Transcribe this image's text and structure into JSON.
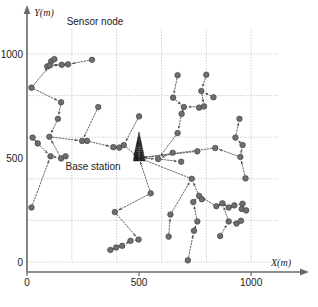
{
  "figure": {
    "title": "",
    "annotations": [
      {
        "name": "sensor-node-label",
        "text": "Sensor node",
        "x": 95,
        "y": 22
      },
      {
        "name": "base-station-label",
        "text": "Base station",
        "x": 93,
        "y": 167
      }
    ],
    "base_station": {
      "label": "Base station",
      "x_m": 500,
      "y_m": 500
    },
    "axis": {
      "x_label": "X(m)",
      "y_label": "Y(m)",
      "x_ticks": [
        {
          "value": 0,
          "label": "0"
        },
        {
          "value": 500,
          "label": "500"
        },
        {
          "value": 1000,
          "label": "1000"
        }
      ],
      "y_ticks": [
        {
          "value": 0,
          "label": "0"
        },
        {
          "value": 500,
          "label": "500"
        },
        {
          "value": 1000,
          "label": "1000"
        }
      ],
      "x_range": [
        0,
        1120
      ],
      "y_range": [
        0,
        1120
      ],
      "grid": true,
      "grid_step": 200
    }
  },
  "chart_data": {
    "type": "scatter",
    "title": "",
    "xlabel": "X(m)",
    "ylabel": "Y(m)",
    "xlim": [
      0,
      1120
    ],
    "ylim": [
      0,
      1120
    ],
    "grid": true,
    "grid_step": 200,
    "legend": [],
    "annotations": [
      "Sensor node",
      "Base station"
    ],
    "marker": {
      "shape": "circle",
      "color": "#6e6e6e",
      "edge": "#3a3a3a",
      "size": 4.6
    },
    "edge_style": {
      "color": "#4a4a4a",
      "dash": "dotted",
      "arrow": true
    },
    "base_station": {
      "x": 500,
      "y": 500
    },
    "nodes": [
      {
        "id": 0,
        "x": 500,
        "y": 500
      },
      {
        "id": 1,
        "x": 108,
        "y": 965
      },
      {
        "id": 2,
        "x": 122,
        "y": 975
      },
      {
        "id": 3,
        "x": 90,
        "y": 940
      },
      {
        "id": 4,
        "x": 102,
        "y": 945
      },
      {
        "id": 5,
        "x": 155,
        "y": 948
      },
      {
        "id": 6,
        "x": 183,
        "y": 950
      },
      {
        "id": 7,
        "x": 290,
        "y": 972
      },
      {
        "id": 8,
        "x": 20,
        "y": 838
      },
      {
        "id": 9,
        "x": 152,
        "y": 768
      },
      {
        "id": 10,
        "x": 138,
        "y": 688
      },
      {
        "id": 11,
        "x": 100,
        "y": 602
      },
      {
        "id": 12,
        "x": 25,
        "y": 598
      },
      {
        "id": 13,
        "x": 48,
        "y": 570
      },
      {
        "id": 14,
        "x": 105,
        "y": 508
      },
      {
        "id": 15,
        "x": 152,
        "y": 498
      },
      {
        "id": 16,
        "x": 172,
        "y": 508
      },
      {
        "id": 17,
        "x": 20,
        "y": 262
      },
      {
        "id": 18,
        "x": 246,
        "y": 582
      },
      {
        "id": 19,
        "x": 268,
        "y": 582
      },
      {
        "id": 20,
        "x": 318,
        "y": 745
      },
      {
        "id": 21,
        "x": 385,
        "y": 552
      },
      {
        "id": 22,
        "x": 412,
        "y": 550
      },
      {
        "id": 23,
        "x": 432,
        "y": 562
      },
      {
        "id": 24,
        "x": 500,
        "y": 700
      },
      {
        "id": 25,
        "x": 552,
        "y": 330
      },
      {
        "id": 26,
        "x": 392,
        "y": 240
      },
      {
        "id": 27,
        "x": 498,
        "y": 108
      },
      {
        "id": 28,
        "x": 462,
        "y": 102
      },
      {
        "id": 29,
        "x": 425,
        "y": 78
      },
      {
        "id": 30,
        "x": 398,
        "y": 70
      },
      {
        "id": 31,
        "x": 372,
        "y": 58
      },
      {
        "id": 32,
        "x": 585,
        "y": 495
      },
      {
        "id": 33,
        "x": 688,
        "y": 482
      },
      {
        "id": 34,
        "x": 650,
        "y": 525
      },
      {
        "id": 35,
        "x": 672,
        "y": 620
      },
      {
        "id": 36,
        "x": 690,
        "y": 712
      },
      {
        "id": 37,
        "x": 700,
        "y": 745
      },
      {
        "id": 38,
        "x": 652,
        "y": 790
      },
      {
        "id": 39,
        "x": 672,
        "y": 898
      },
      {
        "id": 40,
        "x": 768,
        "y": 742
      },
      {
        "id": 41,
        "x": 790,
        "y": 748
      },
      {
        "id": 42,
        "x": 778,
        "y": 822
      },
      {
        "id": 43,
        "x": 800,
        "y": 900
      },
      {
        "id": 44,
        "x": 832,
        "y": 792
      },
      {
        "id": 45,
        "x": 735,
        "y": 400
      },
      {
        "id": 46,
        "x": 768,
        "y": 318
      },
      {
        "id": 47,
        "x": 780,
        "y": 302
      },
      {
        "id": 48,
        "x": 742,
        "y": 288
      },
      {
        "id": 49,
        "x": 760,
        "y": 195
      },
      {
        "id": 50,
        "x": 745,
        "y": 150
      },
      {
        "id": 51,
        "x": 718,
        "y": 8
      },
      {
        "id": 52,
        "x": 632,
        "y": 122
      },
      {
        "id": 53,
        "x": 640,
        "y": 228
      },
      {
        "id": 54,
        "x": 845,
        "y": 268
      },
      {
        "id": 55,
        "x": 872,
        "y": 282
      },
      {
        "id": 56,
        "x": 900,
        "y": 262
      },
      {
        "id": 57,
        "x": 925,
        "y": 272
      },
      {
        "id": 58,
        "x": 962,
        "y": 280
      },
      {
        "id": 59,
        "x": 958,
        "y": 255
      },
      {
        "id": 60,
        "x": 978,
        "y": 248
      },
      {
        "id": 61,
        "x": 900,
        "y": 195
      },
      {
        "id": 62,
        "x": 935,
        "y": 185
      },
      {
        "id": 63,
        "x": 955,
        "y": 198
      },
      {
        "id": 64,
        "x": 862,
        "y": 125
      },
      {
        "id": 65,
        "x": 975,
        "y": 402
      },
      {
        "id": 66,
        "x": 952,
        "y": 505
      },
      {
        "id": 67,
        "x": 962,
        "y": 562
      },
      {
        "id": 68,
        "x": 930,
        "y": 598
      },
      {
        "id": 69,
        "x": 948,
        "y": 688
      },
      {
        "id": 70,
        "x": 840,
        "y": 548
      },
      {
        "id": 71,
        "x": 760,
        "y": 532
      }
    ],
    "edges": [
      [
        2,
        1
      ],
      [
        1,
        4
      ],
      [
        3,
        4
      ],
      [
        4,
        5
      ],
      [
        6,
        5
      ],
      [
        7,
        6
      ],
      [
        5,
        4
      ],
      [
        8,
        4
      ],
      [
        8,
        9
      ],
      [
        9,
        10
      ],
      [
        10,
        11
      ],
      [
        12,
        13
      ],
      [
        13,
        14
      ],
      [
        17,
        14
      ],
      [
        14,
        15
      ],
      [
        16,
        15
      ],
      [
        15,
        11
      ],
      [
        11,
        18
      ],
      [
        20,
        18
      ],
      [
        18,
        19
      ],
      [
        19,
        21
      ],
      [
        21,
        22
      ],
      [
        22,
        23
      ],
      [
        23,
        0
      ],
      [
        24,
        23
      ],
      [
        25,
        26
      ],
      [
        26,
        27
      ],
      [
        27,
        28
      ],
      [
        28,
        29
      ],
      [
        29,
        30
      ],
      [
        30,
        31
      ],
      [
        25,
        0
      ],
      [
        0,
        32
      ],
      [
        32,
        33
      ],
      [
        34,
        32
      ],
      [
        35,
        32
      ],
      [
        36,
        35
      ],
      [
        37,
        36
      ],
      [
        38,
        37
      ],
      [
        39,
        38
      ],
      [
        40,
        41
      ],
      [
        41,
        37
      ],
      [
        42,
        41
      ],
      [
        43,
        42
      ],
      [
        44,
        42
      ],
      [
        45,
        0
      ],
      [
        46,
        45
      ],
      [
        47,
        46
      ],
      [
        48,
        46
      ],
      [
        49,
        48
      ],
      [
        50,
        49
      ],
      [
        51,
        50
      ],
      [
        52,
        53
      ],
      [
        53,
        45
      ],
      [
        54,
        46
      ],
      [
        55,
        54
      ],
      [
        56,
        55
      ],
      [
        57,
        56
      ],
      [
        58,
        57
      ],
      [
        59,
        58
      ],
      [
        60,
        59
      ],
      [
        61,
        55
      ],
      [
        62,
        61
      ],
      [
        63,
        62
      ],
      [
        64,
        61
      ],
      [
        65,
        66
      ],
      [
        66,
        67
      ],
      [
        67,
        68
      ],
      [
        68,
        69
      ],
      [
        70,
        0
      ],
      [
        66,
        70
      ],
      [
        71,
        0
      ]
    ]
  }
}
